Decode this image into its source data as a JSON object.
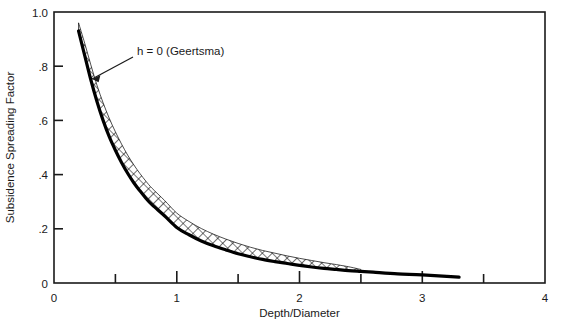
{
  "chart_data": {
    "type": "line",
    "title": "",
    "xlabel": "Depth/Diameter",
    "ylabel": "Subsidence Spreading Factor",
    "xlim": [
      0,
      4
    ],
    "ylim": [
      0,
      1.0
    ],
    "grid": false,
    "legend": "none",
    "x_ticks": [
      0,
      1,
      2,
      3,
      4
    ],
    "x_tick_labels": [
      "0",
      "1",
      "2",
      "3",
      "4"
    ],
    "x_minor_ticks": [
      0.5,
      1.5,
      2.5,
      3.5
    ],
    "y_ticks": [
      0,
      0.2,
      0.4,
      0.6,
      0.8,
      1.0
    ],
    "y_tick_labels": [
      "0",
      ".2",
      ".4",
      ".6",
      ".8",
      "1.0"
    ],
    "series": [
      {
        "name": "h = 0 (Geertsma)",
        "style": "thick-solid-black",
        "color": "#000000",
        "x": [
          0.2,
          0.25,
          0.3,
          0.35,
          0.4,
          0.45,
          0.5,
          0.55,
          0.6,
          0.65,
          0.7,
          0.75,
          0.8,
          0.9,
          1.0,
          1.1,
          1.2,
          1.3,
          1.4,
          1.5,
          1.6,
          1.7,
          1.8,
          1.9,
          2.0,
          2.1,
          2.2,
          2.3,
          2.4,
          2.5,
          2.6,
          2.8,
          3.0,
          3.3
        ],
        "y": [
          0.93,
          0.84,
          0.75,
          0.67,
          0.6,
          0.54,
          0.49,
          0.445,
          0.405,
          0.37,
          0.34,
          0.312,
          0.288,
          0.248,
          0.205,
          0.178,
          0.155,
          0.137,
          0.122,
          0.108,
          0.097,
          0.087,
          0.079,
          0.072,
          0.065,
          0.059,
          0.054,
          0.05,
          0.046,
          0.043,
          0.04,
          0.034,
          0.03,
          0.022
        ]
      },
      {
        "name": "upper-band-edge",
        "style": "cross-hatched-band",
        "color": "#000000",
        "x": [
          0.2,
          0.25,
          0.3,
          0.35,
          0.4,
          0.45,
          0.5,
          0.55,
          0.6,
          0.65,
          0.7,
          0.75,
          0.8,
          0.9,
          1.0,
          1.1,
          1.2,
          1.3,
          1.4,
          1.5,
          1.6,
          1.7,
          1.8,
          1.9,
          2.0,
          2.1,
          2.2,
          2.3,
          2.4,
          2.5
        ],
        "y": [
          0.96,
          0.885,
          0.805,
          0.73,
          0.665,
          0.608,
          0.558,
          0.513,
          0.472,
          0.436,
          0.404,
          0.375,
          0.349,
          0.305,
          0.258,
          0.227,
          0.201,
          0.18,
          0.162,
          0.146,
          0.132,
          0.12,
          0.11,
          0.1,
          0.091,
          0.083,
          0.075,
          0.068,
          0.06,
          0.05
        ]
      }
    ],
    "annotations": [
      {
        "text": "h = 0 (Geertsma)",
        "text_x": 0.44,
        "text_y": 0.845,
        "arrow_to_x": 0.275,
        "arrow_to_y": 0.76
      }
    ]
  },
  "axes": {
    "x_title": "Depth/Diameter",
    "y_title": "Subsidence Spreading Factor",
    "x_labels": [
      "0",
      "1",
      "2",
      "3",
      "4"
    ],
    "y_labels": [
      "0",
      ".2",
      ".4",
      ".6",
      ".8",
      "1.0"
    ]
  },
  "annotation": {
    "label": "h = 0 (Geertsma)"
  },
  "colors": {
    "curve": "#000000",
    "frame": "#1a1a1a",
    "text": "#1a1a1a",
    "background": "#ffffff"
  }
}
